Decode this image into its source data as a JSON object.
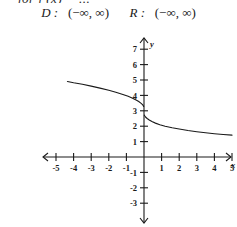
{
  "top_clipped_text": "for  f (x) = ...",
  "answer": {
    "domain_label": "D :",
    "domain_value": "(−∞, ∞)",
    "range_label": "R :",
    "range_value": "(−∞, ∞)"
  },
  "chart_data": {
    "type": "line",
    "title": "",
    "xlabel": "x",
    "ylabel": "y",
    "xlim": [
      -5.5,
      5.5
    ],
    "ylim": [
      -3.5,
      7.5
    ],
    "grid": false,
    "legend": null,
    "x_ticks": [
      -5,
      -4,
      -3,
      -2,
      -1,
      1,
      2,
      3,
      4,
      5
    ],
    "x_tick_labels": [
      "-5",
      "-4",
      "-3",
      "-2",
      "-1",
      "1",
      "2",
      "3",
      "4",
      "5"
    ],
    "y_ticks": [
      7,
      6,
      5,
      4,
      3,
      2,
      1,
      -1,
      -2,
      -3
    ],
    "y_tick_labels": [
      "7",
      "6",
      "5",
      "4",
      "3",
      "2",
      "1",
      "-1",
      "-2",
      "-3"
    ],
    "axis_arrows": [
      "left",
      "right",
      "up",
      "down"
    ],
    "series": [
      {
        "name": "left-branch",
        "points": [
          [
            -4.35,
            4.9
          ],
          [
            -4.0,
            4.82
          ],
          [
            -3.5,
            4.72
          ],
          [
            -3.0,
            4.6
          ],
          [
            -2.5,
            4.47
          ],
          [
            -2.0,
            4.33
          ],
          [
            -1.6,
            4.2
          ],
          [
            -1.2,
            4.06
          ],
          [
            -0.9,
            3.94
          ],
          [
            -0.65,
            3.82
          ],
          [
            -0.45,
            3.7
          ],
          [
            -0.3,
            3.6
          ],
          [
            -0.18,
            3.5
          ],
          [
            -0.1,
            3.42
          ],
          [
            -0.05,
            3.35
          ],
          [
            -0.02,
            3.28
          ]
        ]
      },
      {
        "name": "right-branch",
        "points": [
          [
            0.02,
            2.72
          ],
          [
            0.05,
            2.66
          ],
          [
            0.1,
            2.58
          ],
          [
            0.18,
            2.5
          ],
          [
            0.3,
            2.4
          ],
          [
            0.45,
            2.3
          ],
          [
            0.65,
            2.2
          ],
          [
            0.9,
            2.1
          ],
          [
            1.2,
            2.0
          ],
          [
            1.6,
            1.9
          ],
          [
            2.0,
            1.82
          ],
          [
            2.5,
            1.72
          ],
          [
            3.0,
            1.64
          ],
          [
            3.5,
            1.57
          ],
          [
            4.0,
            1.51
          ],
          [
            4.5,
            1.46
          ],
          [
            5.0,
            1.42
          ]
        ]
      }
    ]
  }
}
